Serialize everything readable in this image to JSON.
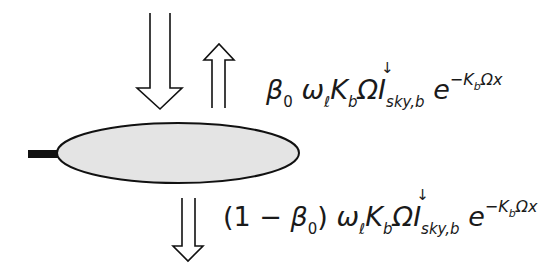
{
  "diagram": {
    "type": "leaf radiation schematic",
    "elements": {
      "leaf": {
        "shape": "ellipse",
        "fill": "#e4e4e4",
        "stroke": "#111111"
      },
      "petiole": {
        "shape": "stem",
        "fill": "#111111"
      },
      "incoming_arrow": {
        "direction": "down",
        "meaning": "incoming sky diffuse radiation"
      },
      "reflected_arrow": {
        "direction": "up",
        "meaning": "upward scattered radiation"
      },
      "transmitted_arrow": {
        "direction": "down",
        "meaning": "downward scattered radiation"
      }
    },
    "upper_formula": {
      "coef": "β",
      "coef_sub": "0",
      "omega": "ω",
      "omega_sub": "ℓ",
      "K": "K",
      "K_sub": "b",
      "Omega": "Ω",
      "I": "I",
      "I_sup": "↓",
      "I_sub": "sky,b",
      "e": "e",
      "exp_prefix": "−K",
      "exp_sub": "b",
      "exp_suffix": "Ωx"
    },
    "lower_formula": {
      "open": "(1 − ",
      "coef": "β",
      "coef_sub": "0",
      "close": ")",
      "omega": "ω",
      "omega_sub": "ℓ",
      "K": "K",
      "K_sub": "b",
      "Omega": "Ω",
      "I": "I",
      "I_sup": "↓",
      "I_sub": "sky,b",
      "e": "e",
      "exp_prefix": "−K",
      "exp_sub": "b",
      "exp_suffix": "Ωx"
    }
  }
}
